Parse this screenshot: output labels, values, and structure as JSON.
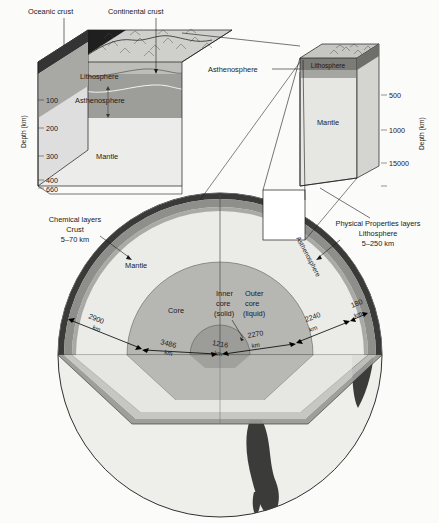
{
  "figure": {
    "depth_axis_label": "Depth (km)"
  },
  "left_block": {
    "callouts": {
      "oceanic_crust": "Oceanic crust",
      "continental_crust": "Continental crust"
    },
    "layers": {
      "lithosphere": "Lithosphere",
      "asthenosphere": "Asthenosphere",
      "mantle": "Mantle"
    },
    "axis_label": "Depth (km)",
    "ticks": [
      "100",
      "200",
      "300",
      "400",
      "660"
    ]
  },
  "right_block": {
    "callout_asthenosphere": "Asthenosphere",
    "layers": {
      "lithosphere": "Lithosphere",
      "mantle": "Mantle"
    },
    "axis_label": "Depth (km)",
    "ticks": [
      "500",
      "1000",
      "15000"
    ]
  },
  "globe": {
    "legend_left": {
      "heading": "Chemical layers",
      "layer": "Crust",
      "thickness": "5–70 km"
    },
    "legend_right": {
      "heading": "Physical Properties layers",
      "layer": "Lithosphere",
      "thickness": "5–250 km"
    },
    "asthenosphere_label": "Asthenosphere",
    "layers": {
      "mantle": "Mantle",
      "core": "Core",
      "inner_core": "Inner\ncore\n(solid)",
      "inner_core_l1": "Inner",
      "inner_core_l2": "core",
      "inner_core_l3": "(solid)",
      "outer_core_l1": "Outer",
      "outer_core_l2": "core",
      "outer_core_l3": "(liquid)"
    },
    "dimensions": [
      {
        "value": "2900",
        "unit": "km",
        "layer": "mantle-thickness"
      },
      {
        "value": "3486",
        "unit": "km",
        "layer": "core-radius"
      },
      {
        "value": "1216",
        "unit": "km",
        "layer": "inner-core-radius"
      },
      {
        "value": "2270",
        "unit": "km",
        "layer": "outer-core-thickness"
      },
      {
        "value": "2240",
        "unit": "km",
        "layer": "lower-mantle"
      },
      {
        "value": "180",
        "unit": "km",
        "layer": "lithosphere-thickness"
      }
    ]
  },
  "colors": {
    "page_bg": "#fbfbfa",
    "ocean_crust_dark": "#1d1d1d",
    "continent_surface": "#c9c9c6",
    "lithosphere_band": "#8f8f8c",
    "asthenosphere_band": "#9a9a97",
    "mantle_light": "#e9e9e6",
    "core_mid": "#b4b4b1",
    "inner_core_dark": "#9b9b98",
    "crust_rim": "#3a3a38",
    "continent_dark": "#3d3d3b",
    "outline": "#1a1a1a"
  }
}
